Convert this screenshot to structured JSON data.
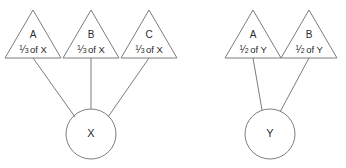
{
  "canvas": {
    "width": 346,
    "height": 168,
    "background": "#ffffff",
    "stroke_color": "#7d7d7d",
    "text_color": "#2b2b2b"
  },
  "diagram": {
    "type": "part-whole-fraction-diagram",
    "groups": [
      {
        "id": "group-x",
        "whole": {
          "label": "X",
          "shape": "circle"
        },
        "parts": [
          {
            "id": "part-x-a",
            "label": "A",
            "shape": "triangle",
            "fraction_numerator": "1",
            "fraction_slash": "⁄",
            "fraction_denominator": "3",
            "fraction_of": "of X",
            "fraction_text": "⅓ of X"
          },
          {
            "id": "part-x-b",
            "label": "B",
            "shape": "triangle",
            "fraction_numerator": "1",
            "fraction_slash": "⁄",
            "fraction_denominator": "3",
            "fraction_of": "of X",
            "fraction_text": "⅓ of X"
          },
          {
            "id": "part-x-c",
            "label": "C",
            "shape": "triangle",
            "fraction_numerator": "1",
            "fraction_slash": "⁄",
            "fraction_denominator": "3",
            "fraction_of": "of X",
            "fraction_text": "⅓ of X"
          }
        ]
      },
      {
        "id": "group-y",
        "whole": {
          "label": "Y",
          "shape": "circle"
        },
        "parts": [
          {
            "id": "part-y-a",
            "label": "A",
            "shape": "triangle",
            "fraction_numerator": "1",
            "fraction_slash": "⁄",
            "fraction_denominator": "2",
            "fraction_of": "of Y",
            "fraction_text": "½ of Y"
          },
          {
            "id": "part-y-b",
            "label": "B",
            "shape": "triangle",
            "fraction_numerator": "1",
            "fraction_slash": "⁄",
            "fraction_denominator": "2",
            "fraction_of": "of Y",
            "fraction_text": "½ of Y"
          }
        ]
      }
    ]
  }
}
